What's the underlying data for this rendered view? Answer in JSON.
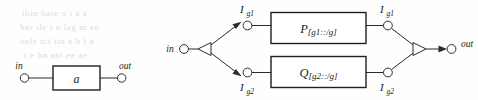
{
  "page": {
    "width": 478,
    "height": 100,
    "background_color": "#fefefe",
    "ink_color": "#222222",
    "bleed_through_color": "#d8d6d2"
  },
  "diagrams": [
    {
      "id": "simple-process",
      "name": "simple-process-diagram",
      "input_port": {
        "label": "in"
      },
      "output_port": {
        "label": "out"
      },
      "box": {
        "label": "a"
      }
    },
    {
      "id": "fork-join-process",
      "name": "fork-join-process-diagram",
      "input_port": {
        "label": "in"
      },
      "output_port": {
        "label": "out"
      },
      "fork": {
        "name": "fork-splitter"
      },
      "join": {
        "name": "join-merger"
      },
      "branches": [
        {
          "input_signal": {
            "label_main": "I",
            "label_sub": "g1"
          },
          "box": {
            "label_main": "P",
            "label_sub": "[g1::/g]"
          },
          "output_signal": {
            "label_main": "I",
            "label_sub": "g1"
          }
        },
        {
          "input_signal": {
            "label_main": "I",
            "label_sub": "g2"
          },
          "box": {
            "label_main": "Q",
            "label_sub": "[g2::/g]"
          },
          "output_signal": {
            "label_main": "I",
            "label_sub": "g2"
          }
        }
      ]
    }
  ],
  "bleed_text": [
    {
      "text": "thin hate o t a a"
    },
    {
      "text": "har ile i o lag m an"
    },
    {
      "text": "oale ici ito a h l a"
    },
    {
      "text": "t e hn  ant ee ae"
    }
  ]
}
